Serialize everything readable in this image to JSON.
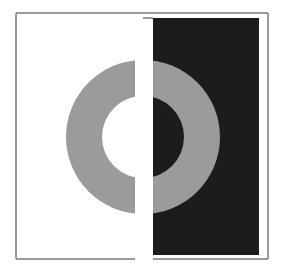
{
  "figure": {
    "title": "",
    "canvas": {
      "width": 282,
      "height": 272
    },
    "colors": {
      "background": "#ffffff",
      "frame": "#7a7a7a",
      "ring": "#9b9b9b",
      "dark_panel": "#1c1c1c"
    },
    "frame": {
      "left": 16,
      "top": 13,
      "right": 268,
      "bottom": 259,
      "bottom_gap": [
        135,
        153
      ]
    },
    "dark_panel": {
      "x": 153,
      "y": 18,
      "width": 106,
      "height": 237,
      "top_tab_from_x": 143
    },
    "ring": {
      "cx": 143,
      "cy": 137,
      "outer_r": 77,
      "inner_r": 41,
      "gap_left": 135,
      "gap_right": 153
    }
  }
}
